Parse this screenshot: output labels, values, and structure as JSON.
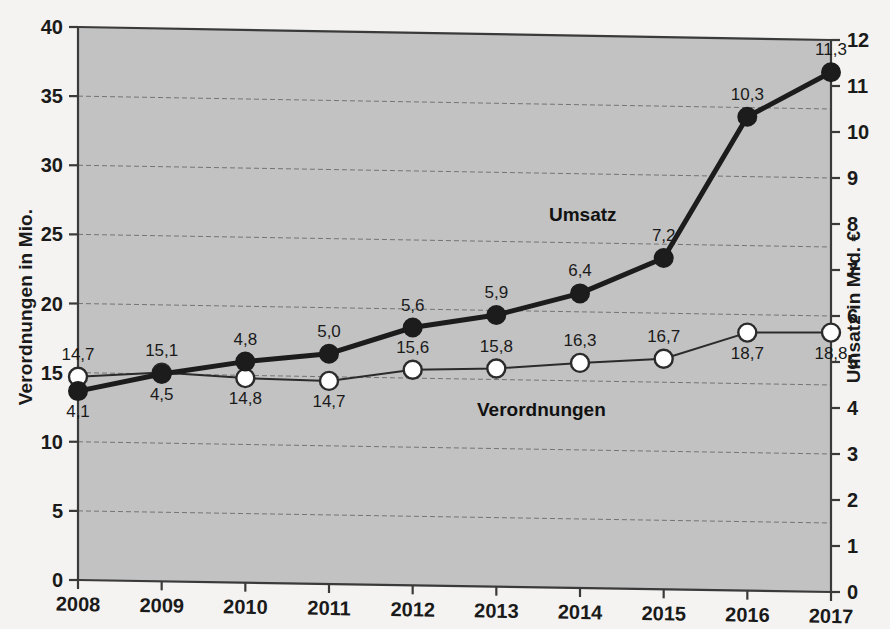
{
  "chart_data": {
    "type": "line",
    "title": "",
    "subtitle": "",
    "xlabel": "",
    "categories": [
      "2008",
      "2009",
      "2010",
      "2011",
      "2012",
      "2013",
      "2014",
      "2015",
      "2016",
      "2017"
    ],
    "grid": true,
    "legend_position": "inline-annotation",
    "axes": {
      "left": {
        "label": "Verordnungen in Mio.",
        "ticks": [
          "0",
          "5",
          "10",
          "15",
          "20",
          "25",
          "30",
          "35",
          "40"
        ],
        "tick_values": [
          0,
          5,
          10,
          15,
          20,
          25,
          30,
          35,
          40
        ],
        "min": 0,
        "max": 40
      },
      "right": {
        "label": "Umsatz in Mrd. €",
        "ticks": [
          "0",
          "1",
          "2",
          "3",
          "4",
          "5",
          "6",
          "7",
          "8",
          "9",
          "10",
          "11",
          "12"
        ],
        "tick_values": [
          0,
          1,
          2,
          3,
          4,
          5,
          6,
          7,
          8,
          9,
          10,
          11,
          12
        ],
        "min": 0,
        "max": 12
      }
    },
    "series": [
      {
        "name": "Verordnungen",
        "axis": "left",
        "marker": "open-circle",
        "color": "#ffffff",
        "line_color": "#2b2b2b",
        "values": [
          14.7,
          15.1,
          14.8,
          14.7,
          15.6,
          15.8,
          16.3,
          16.7,
          18.7,
          18.8
        ],
        "labels": [
          "14,7",
          "15,1",
          "14,8",
          "14,7",
          "15,6",
          "15,8",
          "16,3",
          "16,7",
          "18,7",
          "18,8"
        ],
        "label_positions": [
          "above",
          "above",
          "below",
          "below",
          "above",
          "above",
          "above",
          "above",
          "below",
          "below"
        ]
      },
      {
        "name": "Umsatz",
        "axis": "right",
        "marker": "filled-circle",
        "color": "#1c1c1c",
        "line_color": "#1c1c1c",
        "values": [
          4.1,
          4.5,
          4.8,
          5.0,
          5.6,
          5.9,
          6.4,
          7.2,
          10.3,
          11.3
        ],
        "labels": [
          "4,1",
          "4,5",
          "4,8",
          "5,0",
          "5,6",
          "5,9",
          "6,4",
          "7,2",
          "10,3",
          "11,3"
        ],
        "label_positions": [
          "below",
          "below",
          "above",
          "above",
          "above",
          "above",
          "above",
          "above",
          "above",
          "above"
        ]
      }
    ],
    "colors": {
      "plot_background": "#c2c2c2",
      "page_background": "#f4f3f1",
      "axis": "#3a3a3a",
      "gridline": "#5a5a5a",
      "umsatz": "#1c1c1c",
      "verordnungen_fill": "#ffffff",
      "verordnungen_stroke": "#2b2b2b",
      "text": "#1a1a1a"
    },
    "annotations": [
      {
        "text": "Umsatz",
        "series": "Umsatz"
      },
      {
        "text": "Verordnungen",
        "series": "Verordnungen"
      }
    ]
  }
}
